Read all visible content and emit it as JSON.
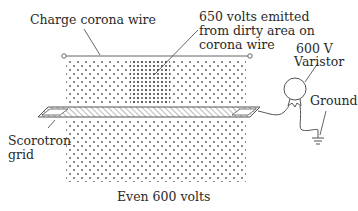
{
  "diagram": {
    "labels": {
      "charge_corona_wire": "Charge corona wire",
      "dirty_area_line1": "650 volts emitted",
      "dirty_area_line2": "from dirty area on",
      "dirty_area_line3": "corona wire",
      "varistor_line1": "600 V",
      "varistor_line2": "Varistor",
      "ground": "Ground",
      "scorotron_line1": "Scorotron",
      "scorotron_line2": "grid",
      "even_voltage": "Even 600 volts"
    },
    "colors": {
      "line": "#555555",
      "dot": "#666666",
      "background": "#ffffff"
    }
  }
}
